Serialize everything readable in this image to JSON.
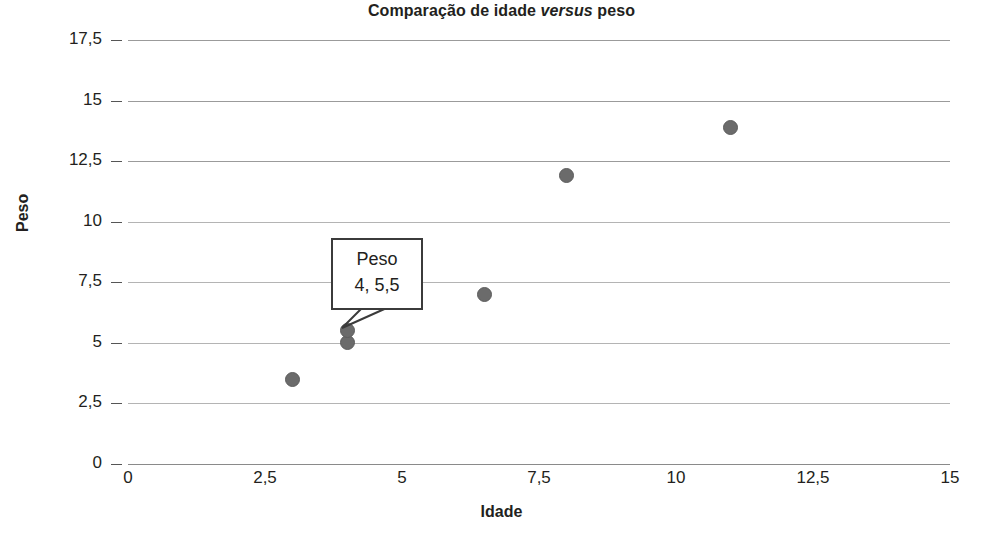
{
  "chart_data": {
    "type": "scatter",
    "title": "Comparação de idade versus peso",
    "title_parts": {
      "before": "Comparação de idade ",
      "italic": "versus",
      "after": " peso"
    },
    "xlabel": "Idade",
    "ylabel": "Peso",
    "xlim": [
      0,
      15
    ],
    "ylim": [
      0,
      17.5
    ],
    "xticks": [
      0,
      2.5,
      5,
      7.5,
      10,
      12.5,
      15
    ],
    "yticks": [
      0,
      2.5,
      5,
      7.5,
      10,
      12.5,
      15,
      17.5
    ],
    "xtick_labels": [
      "0",
      "2,5",
      "5",
      "7,5",
      "10",
      "12,5",
      "15"
    ],
    "ytick_labels": [
      "0",
      "2,5",
      "5",
      "7,5",
      "10",
      "12,5",
      "15",
      "17,5"
    ],
    "grid": "horizontal",
    "legend": "none",
    "series": [
      {
        "name": "Peso",
        "marker_color": "#6b6b6b",
        "points": [
          {
            "x": 3,
            "y": 3.5
          },
          {
            "x": 4,
            "y": 5
          },
          {
            "x": 4,
            "y": 5.5
          },
          {
            "x": 6.5,
            "y": 7
          },
          {
            "x": 8,
            "y": 11.9
          },
          {
            "x": 11,
            "y": 13.9
          }
        ]
      }
    ],
    "annotations": [
      {
        "kind": "callout",
        "title": "Peso",
        "value": "4, 5,5",
        "target": {
          "x": 4,
          "y": 5.5
        }
      }
    ]
  },
  "colors": {
    "marker": "#6b6b6b",
    "gridline": "#9b9b9b",
    "text": "#231f20",
    "callout_border": "#3b3b3b"
  }
}
